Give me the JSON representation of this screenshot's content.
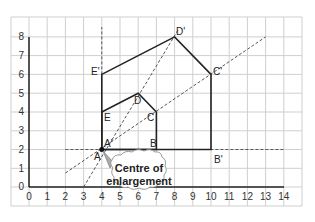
{
  "diagram": {
    "axes": {
      "x_ticks": [
        "0",
        "1",
        "2",
        "3",
        "4",
        "5",
        "6",
        "7",
        "8",
        "9",
        "10",
        "11",
        "12",
        "13",
        "14"
      ],
      "y_ticks": [
        "0",
        "1",
        "2",
        "3",
        "4",
        "5",
        "6",
        "7",
        "8"
      ],
      "xlim": [
        0,
        14
      ],
      "ylim": [
        0,
        8
      ],
      "grid": true
    },
    "original_shape": {
      "labels": [
        "A",
        "B",
        "C",
        "D",
        "E"
      ],
      "points": [
        [
          4,
          2
        ],
        [
          7,
          2
        ],
        [
          7,
          4
        ],
        [
          6,
          5
        ],
        [
          4,
          4
        ]
      ]
    },
    "image_shape": {
      "labels": [
        "A'",
        "B'",
        "C'",
        "D'",
        "E'"
      ],
      "points": [
        [
          4,
          2
        ],
        [
          10,
          2
        ],
        [
          10,
          6
        ],
        [
          8,
          8
        ],
        [
          4,
          6
        ]
      ]
    },
    "centre": {
      "point": [
        4,
        2
      ],
      "label": "A'",
      "callout_line1": "Centre of",
      "callout_line2": "enlargement"
    },
    "scale_factor": 2,
    "colors": {
      "grid": "#cfcfcf",
      "shape": "#222222",
      "dashed": "#555555",
      "callout_arrow": "#999999"
    }
  }
}
